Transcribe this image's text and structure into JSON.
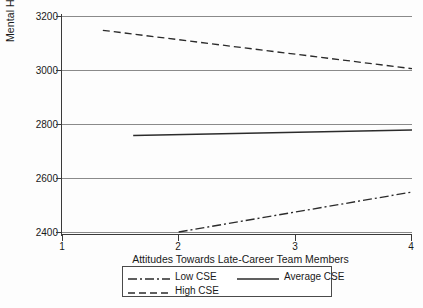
{
  "chart_data": {
    "type": "line",
    "title": "",
    "xlabel": "Attitudes Towards Late-Career Team Members",
    "ylabel": "Mental Health",
    "xlim": [
      1,
      4
    ],
    "ylim": [
      2400,
      3200
    ],
    "xticks": [
      "1",
      "2",
      "3",
      "4"
    ],
    "yticks": [
      "2400",
      "2600",
      "2800",
      "3000",
      "3200"
    ],
    "grid": "horizontal",
    "legend_position": "below-axes",
    "series": [
      {
        "name": "Low CSE",
        "style": "dash-dot",
        "color": "#2b2b2b",
        "x": [
          2.0,
          4.0
        ],
        "y": [
          2400,
          2548
        ]
      },
      {
        "name": "Average CSE",
        "style": "solid",
        "color": "#2b2b2b",
        "x": [
          1.61,
          4.0
        ],
        "y": [
          2757,
          2778
        ]
      },
      {
        "name": "High CSE",
        "style": "dashed",
        "color": "#2b2b2b",
        "x": [
          1.35,
          4.0
        ],
        "y": [
          3147,
          3005
        ]
      }
    ]
  },
  "axes": {
    "ylabel": "Mental Health",
    "xlabel": "Attitudes Towards Late-Career Team Members",
    "ytick_labels": [
      "3200",
      "3000",
      "2800",
      "2600",
      "2400"
    ],
    "xtick_labels": [
      "1",
      "2",
      "3",
      "4"
    ]
  },
  "legend": {
    "low": "Low CSE",
    "average": "Average CSE",
    "high": "High CSE"
  },
  "colors": {
    "line": "#2b2b2b",
    "grid": "#8a8a8a",
    "axis": "#3a3a3a",
    "text": "#1a1a1a",
    "background": "#fdfdfd"
  }
}
